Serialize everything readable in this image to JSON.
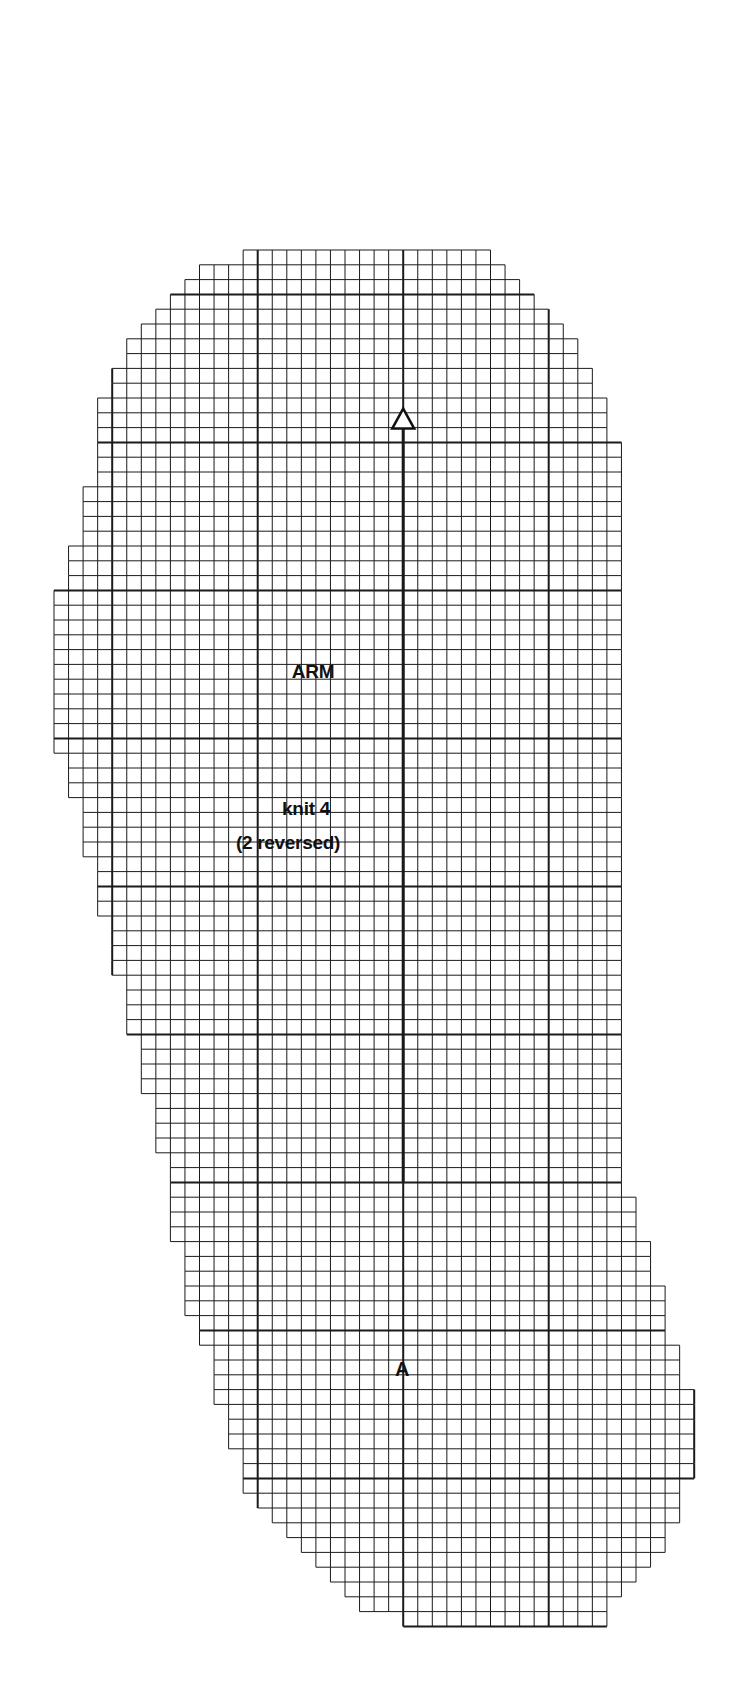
{
  "pattern": {
    "piece_name": "ARM",
    "instruction_line1": "knit 4",
    "instruction_line2": "(2 reversed)",
    "point_marker": "A",
    "arrow_head": "triangle-outline-icon"
  },
  "grid": {
    "origin_x": 54,
    "origin_y": 250,
    "cell_w": 14.55,
    "cell_h": 14.8,
    "major_every": 10,
    "major_col_offset": 4,
    "major_row_offset": 3,
    "line_color": "#1a1a1a",
    "rows": [
      [
        13,
        30
      ],
      [
        10,
        31
      ],
      [
        9,
        32
      ],
      [
        8,
        33
      ],
      [
        7,
        34
      ],
      [
        6,
        35
      ],
      [
        5,
        36
      ],
      [
        5,
        36
      ],
      [
        4,
        37
      ],
      [
        4,
        37
      ],
      [
        3,
        38
      ],
      [
        3,
        38
      ],
      [
        3,
        38
      ],
      [
        3,
        39
      ],
      [
        3,
        39
      ],
      [
        3,
        39
      ],
      [
        2,
        39
      ],
      [
        2,
        39
      ],
      [
        2,
        39
      ],
      [
        2,
        39
      ],
      [
        1,
        39
      ],
      [
        1,
        39
      ],
      [
        1,
        39
      ],
      [
        0,
        39
      ],
      [
        0,
        39
      ],
      [
        0,
        39
      ],
      [
        0,
        39
      ],
      [
        0,
        39
      ],
      [
        0,
        39
      ],
      [
        0,
        39
      ],
      [
        0,
        39
      ],
      [
        0,
        39
      ],
      [
        0,
        39
      ],
      [
        0,
        39
      ],
      [
        1,
        39
      ],
      [
        1,
        39
      ],
      [
        1,
        39
      ],
      [
        2,
        39
      ],
      [
        2,
        39
      ],
      [
        2,
        39
      ],
      [
        2,
        39
      ],
      [
        3,
        39
      ],
      [
        3,
        39
      ],
      [
        3,
        39
      ],
      [
        3,
        39
      ],
      [
        4,
        39
      ],
      [
        4,
        39
      ],
      [
        4,
        39
      ],
      [
        4,
        39
      ],
      [
        5,
        39
      ],
      [
        5,
        39
      ],
      [
        5,
        39
      ],
      [
        5,
        39
      ],
      [
        6,
        39
      ],
      [
        6,
        39
      ],
      [
        6,
        39
      ],
      [
        6,
        39
      ],
      [
        7,
        39
      ],
      [
        7,
        39
      ],
      [
        7,
        39
      ],
      [
        7,
        39
      ],
      [
        8,
        39
      ],
      [
        8,
        39
      ],
      [
        8,
        39
      ],
      [
        8,
        40
      ],
      [
        8,
        40
      ],
      [
        8,
        40
      ],
      [
        9,
        41
      ],
      [
        9,
        41
      ],
      [
        9,
        41
      ],
      [
        9,
        42
      ],
      [
        9,
        42
      ],
      [
        10,
        42
      ],
      [
        10,
        42
      ],
      [
        11,
        43
      ],
      [
        11,
        43
      ],
      [
        11,
        43
      ],
      [
        11,
        44
      ],
      [
        12,
        44
      ],
      [
        12,
        44
      ],
      [
        12,
        44
      ],
      [
        13,
        44
      ],
      [
        13,
        44
      ],
      [
        13,
        43
      ],
      [
        14,
        43
      ],
      [
        15,
        43
      ],
      [
        16,
        42
      ],
      [
        17,
        42
      ],
      [
        18,
        41
      ],
      [
        19,
        40
      ],
      [
        20,
        39
      ],
      [
        21,
        38
      ],
      [
        24,
        38
      ]
    ]
  },
  "center_line": {
    "col": 24,
    "from_row": 12,
    "to_row": 63
  },
  "chart_data": {
    "type": "table",
    "title": "ARM",
    "annotations": [
      "ARM",
      "knit 4",
      "(2 reversed)",
      "A"
    ],
    "grid_columns_max": 44,
    "grid_rows": 93
  }
}
